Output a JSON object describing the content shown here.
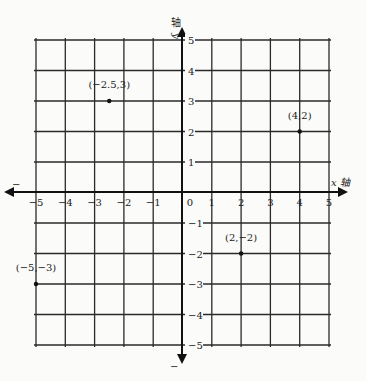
{
  "chart_data": {
    "type": "scatter",
    "title": "",
    "xlabel": "x 轴",
    "ylabel": "y 轴",
    "xlim": [
      -5,
      5
    ],
    "ylim": [
      -5,
      5
    ],
    "grid": true,
    "x_ticks": [
      -5,
      -4,
      -3,
      -2,
      -1,
      0,
      1,
      2,
      3,
      4,
      5
    ],
    "y_ticks": [
      5,
      4,
      3,
      2,
      1,
      -1,
      -2,
      -3,
      -4,
      -5
    ],
    "x_tick_labels": [
      "−5",
      "−4",
      "−3",
      "−2",
      "−1",
      "0",
      "1",
      "2",
      "3",
      "4",
      "5"
    ],
    "y_tick_labels": [
      "5",
      "4",
      "3",
      "2",
      "1",
      "−1",
      "−2",
      "−3",
      "−4",
      "−5"
    ],
    "negative_axis_markers": [
      "−",
      "−"
    ],
    "points": [
      {
        "x": -2.5,
        "y": 3,
        "label": "(−2.5,3)"
      },
      {
        "x": 4,
        "y": 2,
        "label": "(4,2)"
      },
      {
        "x": 2,
        "y": -2,
        "label": "(2,−2)"
      },
      {
        "x": -5,
        "y": -3,
        "label": "(−5,−3)"
      }
    ]
  },
  "axes": {
    "x_label_italic": "x",
    "x_label_cn": "轴",
    "y_label_italic": "y",
    "y_label_cn": "轴",
    "x_neg_marker": "−",
    "y_neg_marker": "−"
  }
}
